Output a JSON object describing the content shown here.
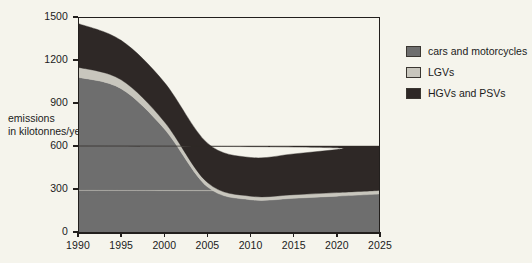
{
  "chart_data": {
    "type": "area",
    "stacked": true,
    "title": "",
    "xlabel": "",
    "ylabel": "emissions in kilotonnes/year",
    "ylabel_lines": [
      "emissions",
      "in kilotonnes/year"
    ],
    "x": [
      1990,
      1995,
      2000,
      2005,
      2010,
      2015,
      2020,
      2025
    ],
    "categories": [
      "1990",
      "1995",
      "2000",
      "2005",
      "2010",
      "2015",
      "2020",
      "2025"
    ],
    "xtick_labels": [
      "1990",
      "1995",
      "2000",
      "2005",
      "2010",
      "2015",
      "2020",
      "2025"
    ],
    "ytick_labels": [
      "0",
      "300",
      "600",
      "900",
      "1200",
      "1500"
    ],
    "yticks": [
      0,
      300,
      600,
      900,
      1200,
      1500
    ],
    "xlim": [
      1990,
      2025
    ],
    "ylim": [
      0,
      1500
    ],
    "grid": false,
    "legend_position": "right",
    "series": [
      {
        "name": "cars and motorcycles",
        "color": "#6e6e6e",
        "values": [
          1080,
          1000,
          720,
          315,
          225,
          235,
          250,
          265
        ]
      },
      {
        "name": "LGVs",
        "color": "#c8c6bd",
        "values": [
          70,
          62,
          50,
          30,
          25,
          25,
          25,
          25
        ]
      },
      {
        "name": "HGVs and PSVs",
        "color": "#2e2826",
        "values": [
          305,
          275,
          275,
          275,
          270,
          285,
          300,
          310
        ]
      }
    ],
    "series_totals": [
      1455,
      1337,
      1045,
      620,
      520,
      545,
      575,
      600
    ]
  },
  "legend": {
    "items": [
      {
        "label": "cars and motorcycles",
        "color": "#6e6e6e"
      },
      {
        "label": "LGVs",
        "color": "#c8c6bd"
      },
      {
        "label": "HGVs and PSVs",
        "color": "#2e2826"
      }
    ]
  },
  "colors": {
    "background": "#f5f4ec",
    "axis": "#221f1d",
    "text": "#1b1b1b"
  }
}
